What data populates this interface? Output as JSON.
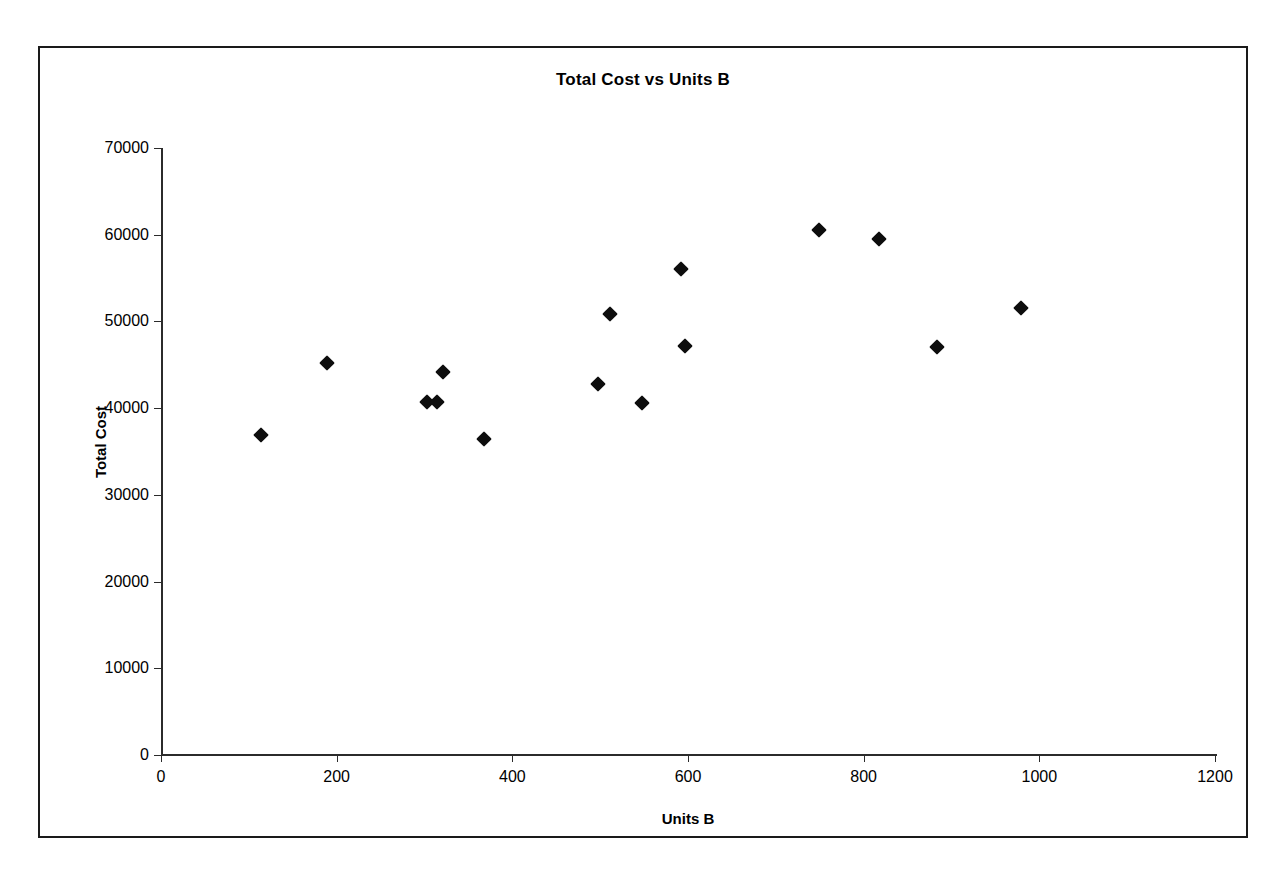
{
  "chart_data": {
    "type": "scatter",
    "title": "Total Cost vs Units B",
    "xlabel": "Units B",
    "ylabel": "Total Cost",
    "xlim": [
      0,
      1200
    ],
    "ylim": [
      0,
      70000
    ],
    "xticks": [
      0,
      200,
      400,
      600,
      800,
      1000,
      1200
    ],
    "yticks": [
      0,
      10000,
      20000,
      30000,
      40000,
      50000,
      60000,
      70000
    ],
    "grid": false,
    "legend": false,
    "marker": "diamond",
    "marker_color": "#0d0d0d",
    "series": [
      {
        "name": "Total Cost",
        "points": [
          {
            "x": 114,
            "y": 36900
          },
          {
            "x": 189,
            "y": 45200
          },
          {
            "x": 303,
            "y": 40700
          },
          {
            "x": 314,
            "y": 40700
          },
          {
            "x": 321,
            "y": 44200
          },
          {
            "x": 368,
            "y": 36400
          },
          {
            "x": 497,
            "y": 42800
          },
          {
            "x": 511,
            "y": 50900
          },
          {
            "x": 548,
            "y": 40600
          },
          {
            "x": 592,
            "y": 56100
          },
          {
            "x": 597,
            "y": 47200
          },
          {
            "x": 749,
            "y": 60600
          },
          {
            "x": 817,
            "y": 59500
          },
          {
            "x": 884,
            "y": 47000
          },
          {
            "x": 979,
            "y": 51500
          }
        ]
      }
    ]
  }
}
